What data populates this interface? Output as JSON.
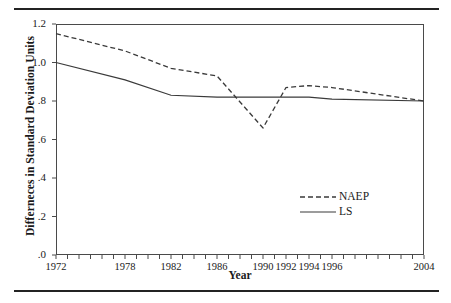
{
  "figure": {
    "ylabel": "Differneces in Standard Deviation Units",
    "xlabel": "Year"
  },
  "chart_data": {
    "type": "line",
    "title": "",
    "subtitle": "",
    "xlabel": "Year",
    "ylabel": "Differneces in Standard Deviation Units",
    "xlim": [
      1972,
      2004
    ],
    "ylim": [
      0.0,
      1.2
    ],
    "grid": false,
    "legend_position": "center-right",
    "y_ticks": [
      0.0,
      0.2,
      0.4,
      0.6,
      0.8,
      1.0,
      1.2
    ],
    "y_tick_labels": [
      ".0",
      ".2",
      ".4",
      ".6",
      ".8",
      "1.0",
      "1.2"
    ],
    "x_tick_positions": [
      1972,
      1973,
      1974,
      1975,
      1976,
      1977,
      1978,
      1979,
      1980,
      1981,
      1982,
      1983,
      1984,
      1985,
      1986,
      1987,
      1988,
      1989,
      1990,
      1991,
      1992,
      1993,
      1994,
      1995,
      1996,
      1997,
      1998,
      1999,
      2000,
      2001,
      2002,
      2003,
      2004
    ],
    "x_tick_labels_shown": [
      "1972",
      "1978",
      "1982",
      "1986",
      "1990",
      "1992",
      "1994",
      "1996",
      "2004"
    ],
    "x_tick_labels_shown_at": [
      1972,
      1978,
      1982,
      1986,
      1990,
      1992,
      1994,
      1996,
      2004
    ],
    "series": [
      {
        "name": "NAEP",
        "style": "dashed",
        "color": "#3a3a3a",
        "x": [
          1972,
          1978,
          1982,
          1986,
          1990,
          1992,
          1994,
          1996,
          2004
        ],
        "values": [
          1.15,
          1.06,
          0.97,
          0.93,
          0.66,
          0.87,
          0.88,
          0.87,
          0.8
        ]
      },
      {
        "name": "LS",
        "style": "solid",
        "color": "#3a3a3a",
        "x": [
          1972,
          1978,
          1982,
          1986,
          1990,
          1992,
          1994,
          1996,
          2004
        ],
        "values": [
          1.0,
          0.91,
          0.83,
          0.82,
          0.82,
          0.82,
          0.82,
          0.81,
          0.8
        ]
      }
    ]
  },
  "legend": {
    "entries": [
      {
        "label": "NAEP",
        "style": "dashed"
      },
      {
        "label": "LS",
        "style": "solid"
      }
    ]
  }
}
